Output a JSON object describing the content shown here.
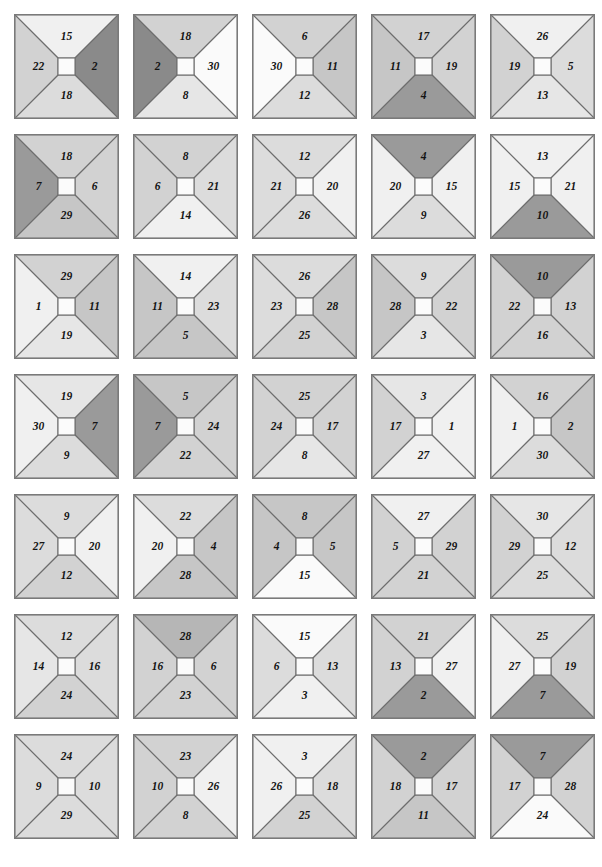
{
  "figure": {
    "rows": 7,
    "cols": 5,
    "tile_size_px": 105,
    "col_pitch_px": 119,
    "row_pitch_px": 120,
    "origin_x_px": 14,
    "origin_y_px": 14,
    "background_color": "#ffffff",
    "edge_color": "#6d6d6d",
    "center_square_color": "#fbfbfb",
    "number_color": "#141414",
    "shade_palette": {
      "white": "#fafafa",
      "lightest": "#f0f0f0",
      "lighter": "#e6e6e6",
      "light": "#dcdcdc",
      "medium_light": "#d2d2d2",
      "medium": "#c6c6c6",
      "medium_dark": "#b6b6b6",
      "dark": "#9a9a9a",
      "darkest": "#8a8a8a"
    }
  },
  "chart_data": {
    "type": "heatmap",
    "xlabel": "",
    "ylabel": "",
    "grid": false,
    "legend": "none",
    "value_range": [
      1,
      30
    ],
    "tiles": [
      {
        "row": 1,
        "col": 1,
        "top": {
          "value": 15,
          "shade": "lightest"
        },
        "right": {
          "value": 2,
          "shade": "darkest"
        },
        "bottom": {
          "value": 18,
          "shade": "light"
        },
        "left": {
          "value": 22,
          "shade": "medium_light"
        }
      },
      {
        "row": 1,
        "col": 2,
        "top": {
          "value": 18,
          "shade": "medium_light"
        },
        "right": {
          "value": 30,
          "shade": "white"
        },
        "bottom": {
          "value": 8,
          "shade": "lighter"
        },
        "left": {
          "value": 2,
          "shade": "darkest"
        }
      },
      {
        "row": 1,
        "col": 3,
        "top": {
          "value": 6,
          "shade": "medium_light"
        },
        "right": {
          "value": 11,
          "shade": "medium"
        },
        "bottom": {
          "value": 12,
          "shade": "light"
        },
        "left": {
          "value": 30,
          "shade": "white"
        }
      },
      {
        "row": 1,
        "col": 4,
        "top": {
          "value": 17,
          "shade": "medium_light"
        },
        "right": {
          "value": 19,
          "shade": "medium_light"
        },
        "bottom": {
          "value": 4,
          "shade": "dark"
        },
        "left": {
          "value": 11,
          "shade": "medium"
        }
      },
      {
        "row": 1,
        "col": 5,
        "top": {
          "value": 26,
          "shade": "lightest"
        },
        "right": {
          "value": 5,
          "shade": "light"
        },
        "bottom": {
          "value": 13,
          "shade": "lighter"
        },
        "left": {
          "value": 19,
          "shade": "medium_light"
        }
      },
      {
        "row": 2,
        "col": 1,
        "top": {
          "value": 18,
          "shade": "medium_light"
        },
        "right": {
          "value": 6,
          "shade": "medium_light"
        },
        "bottom": {
          "value": 29,
          "shade": "medium"
        },
        "left": {
          "value": 7,
          "shade": "dark"
        }
      },
      {
        "row": 2,
        "col": 2,
        "top": {
          "value": 8,
          "shade": "medium_light"
        },
        "right": {
          "value": 21,
          "shade": "light"
        },
        "bottom": {
          "value": 14,
          "shade": "lightest"
        },
        "left": {
          "value": 6,
          "shade": "medium_light"
        }
      },
      {
        "row": 2,
        "col": 3,
        "top": {
          "value": 12,
          "shade": "light"
        },
        "right": {
          "value": 20,
          "shade": "lightest"
        },
        "bottom": {
          "value": 26,
          "shade": "light"
        },
        "left": {
          "value": 21,
          "shade": "light"
        }
      },
      {
        "row": 2,
        "col": 4,
        "top": {
          "value": 4,
          "shade": "dark"
        },
        "right": {
          "value": 15,
          "shade": "lightest"
        },
        "bottom": {
          "value": 9,
          "shade": "light"
        },
        "left": {
          "value": 20,
          "shade": "lightest"
        }
      },
      {
        "row": 2,
        "col": 5,
        "top": {
          "value": 13,
          "shade": "lightest"
        },
        "right": {
          "value": 21,
          "shade": "lightest"
        },
        "bottom": {
          "value": 10,
          "shade": "dark"
        },
        "left": {
          "value": 15,
          "shade": "lightest"
        }
      },
      {
        "row": 3,
        "col": 1,
        "top": {
          "value": 29,
          "shade": "medium_light"
        },
        "right": {
          "value": 11,
          "shade": "medium"
        },
        "bottom": {
          "value": 19,
          "shade": "lighter"
        },
        "left": {
          "value": 1,
          "shade": "lightest"
        }
      },
      {
        "row": 3,
        "col": 2,
        "top": {
          "value": 14,
          "shade": "lightest"
        },
        "right": {
          "value": 23,
          "shade": "light"
        },
        "bottom": {
          "value": 5,
          "shade": "medium"
        },
        "left": {
          "value": 11,
          "shade": "medium"
        }
      },
      {
        "row": 3,
        "col": 3,
        "top": {
          "value": 26,
          "shade": "light"
        },
        "right": {
          "value": 28,
          "shade": "medium"
        },
        "bottom": {
          "value": 25,
          "shade": "medium_light"
        },
        "left": {
          "value": 23,
          "shade": "light"
        }
      },
      {
        "row": 3,
        "col": 4,
        "top": {
          "value": 9,
          "shade": "light"
        },
        "right": {
          "value": 22,
          "shade": "medium_light"
        },
        "bottom": {
          "value": 3,
          "shade": "lighter"
        },
        "left": {
          "value": 28,
          "shade": "medium"
        }
      },
      {
        "row": 3,
        "col": 5,
        "top": {
          "value": 10,
          "shade": "dark"
        },
        "right": {
          "value": 13,
          "shade": "medium_light"
        },
        "bottom": {
          "value": 16,
          "shade": "medium_light"
        },
        "left": {
          "value": 22,
          "shade": "medium_light"
        }
      },
      {
        "row": 4,
        "col": 1,
        "top": {
          "value": 19,
          "shade": "lighter"
        },
        "right": {
          "value": 7,
          "shade": "dark"
        },
        "bottom": {
          "value": 9,
          "shade": "light"
        },
        "left": {
          "value": 30,
          "shade": "lightest"
        }
      },
      {
        "row": 4,
        "col": 2,
        "top": {
          "value": 5,
          "shade": "medium"
        },
        "right": {
          "value": 24,
          "shade": "medium_light"
        },
        "bottom": {
          "value": 22,
          "shade": "medium_light"
        },
        "left": {
          "value": 7,
          "shade": "dark"
        }
      },
      {
        "row": 4,
        "col": 3,
        "top": {
          "value": 25,
          "shade": "medium_light"
        },
        "right": {
          "value": 17,
          "shade": "medium_light"
        },
        "bottom": {
          "value": 8,
          "shade": "lighter"
        },
        "left": {
          "value": 24,
          "shade": "medium_light"
        }
      },
      {
        "row": 4,
        "col": 4,
        "top": {
          "value": 3,
          "shade": "lighter"
        },
        "right": {
          "value": 1,
          "shade": "lightest"
        },
        "bottom": {
          "value": 27,
          "shade": "lightest"
        },
        "left": {
          "value": 17,
          "shade": "medium_light"
        }
      },
      {
        "row": 4,
        "col": 5,
        "top": {
          "value": 16,
          "shade": "medium_light"
        },
        "right": {
          "value": 2,
          "shade": "medium"
        },
        "bottom": {
          "value": 30,
          "shade": "light"
        },
        "left": {
          "value": 1,
          "shade": "lightest"
        }
      },
      {
        "row": 5,
        "col": 1,
        "top": {
          "value": 9,
          "shade": "light"
        },
        "right": {
          "value": 20,
          "shade": "lightest"
        },
        "bottom": {
          "value": 12,
          "shade": "medium_light"
        },
        "left": {
          "value": 27,
          "shade": "light"
        }
      },
      {
        "row": 5,
        "col": 2,
        "top": {
          "value": 22,
          "shade": "light"
        },
        "right": {
          "value": 4,
          "shade": "medium"
        },
        "bottom": {
          "value": 28,
          "shade": "medium"
        },
        "left": {
          "value": 20,
          "shade": "lightest"
        }
      },
      {
        "row": 5,
        "col": 3,
        "top": {
          "value": 8,
          "shade": "medium"
        },
        "right": {
          "value": 5,
          "shade": "medium"
        },
        "bottom": {
          "value": 15,
          "shade": "white"
        },
        "left": {
          "value": 4,
          "shade": "medium"
        }
      },
      {
        "row": 5,
        "col": 4,
        "top": {
          "value": 27,
          "shade": "lightest"
        },
        "right": {
          "value": 29,
          "shade": "medium_light"
        },
        "bottom": {
          "value": 21,
          "shade": "medium_light"
        },
        "left": {
          "value": 5,
          "shade": "medium_light"
        }
      },
      {
        "row": 5,
        "col": 5,
        "top": {
          "value": 30,
          "shade": "lighter"
        },
        "right": {
          "value": 12,
          "shade": "light"
        },
        "bottom": {
          "value": 25,
          "shade": "light"
        },
        "left": {
          "value": 29,
          "shade": "medium_light"
        }
      },
      {
        "row": 6,
        "col": 1,
        "top": {
          "value": 12,
          "shade": "light"
        },
        "right": {
          "value": 16,
          "shade": "light"
        },
        "bottom": {
          "value": 24,
          "shade": "medium_light"
        },
        "left": {
          "value": 14,
          "shade": "lighter"
        }
      },
      {
        "row": 6,
        "col": 2,
        "top": {
          "value": 28,
          "shade": "medium_dark"
        },
        "right": {
          "value": 6,
          "shade": "medium_light"
        },
        "bottom": {
          "value": 23,
          "shade": "medium_light"
        },
        "left": {
          "value": 16,
          "shade": "medium_light"
        }
      },
      {
        "row": 6,
        "col": 3,
        "top": {
          "value": 15,
          "shade": "white"
        },
        "right": {
          "value": 13,
          "shade": "light"
        },
        "bottom": {
          "value": 3,
          "shade": "lightest"
        },
        "left": {
          "value": 6,
          "shade": "light"
        }
      },
      {
        "row": 6,
        "col": 4,
        "top": {
          "value": 21,
          "shade": "medium_light"
        },
        "right": {
          "value": 27,
          "shade": "lightest"
        },
        "bottom": {
          "value": 2,
          "shade": "dark"
        },
        "left": {
          "value": 13,
          "shade": "medium_light"
        }
      },
      {
        "row": 6,
        "col": 5,
        "top": {
          "value": 25,
          "shade": "light"
        },
        "right": {
          "value": 19,
          "shade": "medium_light"
        },
        "bottom": {
          "value": 7,
          "shade": "dark"
        },
        "left": {
          "value": 27,
          "shade": "lightest"
        }
      },
      {
        "row": 7,
        "col": 1,
        "top": {
          "value": 24,
          "shade": "light"
        },
        "right": {
          "value": 10,
          "shade": "light"
        },
        "bottom": {
          "value": 29,
          "shade": "light"
        },
        "left": {
          "value": 9,
          "shade": "light"
        }
      },
      {
        "row": 7,
        "col": 2,
        "top": {
          "value": 23,
          "shade": "medium_light"
        },
        "right": {
          "value": 26,
          "shade": "lightest"
        },
        "bottom": {
          "value": 8,
          "shade": "medium_light"
        },
        "left": {
          "value": 10,
          "shade": "medium_light"
        }
      },
      {
        "row": 7,
        "col": 3,
        "top": {
          "value": 3,
          "shade": "lightest"
        },
        "right": {
          "value": 18,
          "shade": "light"
        },
        "bottom": {
          "value": 25,
          "shade": "medium_light"
        },
        "left": {
          "value": 26,
          "shade": "lightest"
        }
      },
      {
        "row": 7,
        "col": 4,
        "top": {
          "value": 2,
          "shade": "dark"
        },
        "right": {
          "value": 17,
          "shade": "medium_light"
        },
        "bottom": {
          "value": 11,
          "shade": "medium"
        },
        "left": {
          "value": 18,
          "shade": "medium_light"
        }
      },
      {
        "row": 7,
        "col": 5,
        "top": {
          "value": 7,
          "shade": "dark"
        },
        "right": {
          "value": 28,
          "shade": "medium_light"
        },
        "bottom": {
          "value": 24,
          "shade": "white"
        },
        "left": {
          "value": 17,
          "shade": "medium_light"
        }
      }
    ]
  }
}
